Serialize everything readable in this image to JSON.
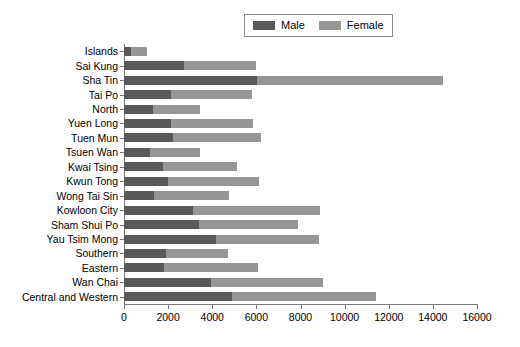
{
  "chart_data": {
    "type": "bar",
    "orientation": "horizontal",
    "stacked": true,
    "title": "",
    "subtitle": "",
    "xlabel": "",
    "ylabel": "",
    "xlim": [
      0,
      16000
    ],
    "ylim": null,
    "grid": false,
    "legend_position": "top-center",
    "xticks": [
      0,
      2000,
      4000,
      6000,
      8000,
      10000,
      12000,
      14000,
      16000
    ],
    "xtick_labels": [
      "0",
      "2000",
      "4000",
      "6000",
      "8000",
      "10000",
      "12000",
      "14000",
      "16000"
    ],
    "categories": [
      "Islands",
      "Sai Kung",
      "Sha Tin",
      "Tai Po",
      "North",
      "Yuen Long",
      "Tuen Mun",
      "Tsuen Wan",
      "Kwai Tsing",
      "Kwun Tong",
      "Wong Tai Sin",
      "Kowloon City",
      "Sham Shui Po",
      "Yau Tsim Mong",
      "Southern",
      "Eastern",
      "Wan Chai",
      "Central and Western"
    ],
    "series": [
      {
        "name": "Male",
        "color": "#595959",
        "values": [
          330,
          2700,
          6050,
          2150,
          1300,
          2150,
          2200,
          1180,
          1770,
          2000,
          1350,
          3130,
          3400,
          4150,
          1900,
          1830,
          3950,
          4900
        ]
      },
      {
        "name": "Female",
        "color": "#969696",
        "values": [
          700,
          3300,
          8400,
          3650,
          2150,
          3700,
          4000,
          2280,
          3340,
          4100,
          3400,
          5750,
          4500,
          4700,
          2800,
          4250,
          5050,
          6500
        ]
      }
    ],
    "totals": [
      1030,
      6000,
      14450,
      5800,
      3450,
      5850,
      6200,
      3460,
      5110,
      6100,
      4750,
      8880,
      7900,
      8850,
      4700,
      6080,
      9000,
      11400
    ]
  },
  "legend": {
    "entries": [
      {
        "label": "Male",
        "color": "#595959",
        "swatch_name": "male-swatch"
      },
      {
        "label": "Female",
        "color": "#969696",
        "swatch_name": "female-swatch"
      }
    ]
  }
}
